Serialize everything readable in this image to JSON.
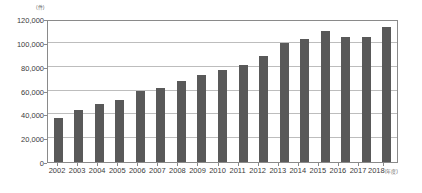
{
  "chart_data": {
    "type": "bar",
    "title": "",
    "subtitle": "",
    "xlabel": "",
    "ylabel": "",
    "y_unit_label": "(件)",
    "x_unit_label": "(年度)",
    "categories": [
      "2002",
      "2003",
      "2004",
      "2005",
      "2006",
      "2007",
      "2008",
      "2009",
      "2010",
      "2011",
      "2012",
      "2013",
      "2014",
      "2015",
      "2016",
      "2017",
      "2018"
    ],
    "values": [
      37000,
      44000,
      49000,
      52000,
      60000,
      62000,
      68000,
      73000,
      77000,
      81000,
      89000,
      100000,
      103000,
      110000,
      105000,
      105000,
      113000
    ],
    "ylim": [
      0,
      120000
    ],
    "ytick_values": [
      0,
      20000,
      40000,
      60000,
      80000,
      100000,
      120000
    ],
    "ytick_labels": [
      "0",
      "20,000",
      "40,000",
      "60,000",
      "80,000",
      "100,000",
      "120,000"
    ],
    "grid": true,
    "legend": false,
    "legend_position": "none",
    "bar_color": "#595959",
    "gridline_color": "#bdbdbd",
    "axis_color": "#8a8a8a",
    "background_color": "#ffffff",
    "text_color": "#3b3b3b"
  }
}
